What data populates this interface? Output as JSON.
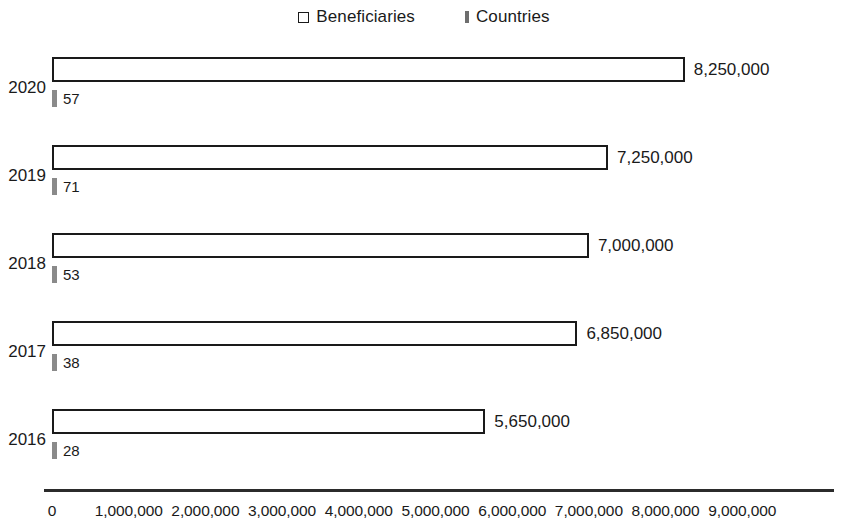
{
  "chart_data": {
    "type": "bar",
    "orientation": "horizontal",
    "title": "",
    "xlabel": "",
    "ylabel": "",
    "categories": [
      "2020",
      "2019",
      "2018",
      "2017",
      "2016"
    ],
    "series": [
      {
        "name": "Beneficiaries",
        "values": [
          8250000,
          7250000,
          7000000,
          6850000,
          5650000
        ],
        "labels": [
          "8,250,000",
          "7,250,000",
          "7,000,000",
          "6,850,000",
          "5,650,000"
        ],
        "marker": "hollow-square",
        "color": "#ffffff",
        "border_color": "#1a1a1a"
      },
      {
        "name": "Countries",
        "values": [
          57,
          71,
          53,
          38,
          28
        ],
        "labels": [
          "57",
          "71",
          "53",
          "38",
          "28"
        ],
        "marker": "solid-bar",
        "color": "#8a8a8a"
      }
    ],
    "xlim": [
      0,
      9000000
    ],
    "xticks": [
      0,
      1000000,
      2000000,
      3000000,
      4000000,
      5000000,
      6000000,
      7000000,
      8000000,
      9000000
    ],
    "xtick_labels": [
      "0",
      "1,000,000",
      "2,000,000",
      "3,000,000",
      "4,000,000",
      "5,000,000",
      "6,000,000",
      "7,000,000",
      "8,000,000",
      "9,000,000"
    ],
    "grid": false,
    "legend_position": "top-center"
  },
  "legend": {
    "entries": [
      {
        "label": "Beneficiaries",
        "marker": "hollow-square-icon"
      },
      {
        "label": "Countries",
        "marker": "solid-bar-icon"
      }
    ]
  }
}
